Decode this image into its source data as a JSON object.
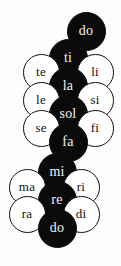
{
  "diagram": {
    "background_color": "#fdfdfd",
    "filled_color": "#0a0a0a",
    "filled_text_color": "#f2f2f2",
    "open_color": "#ffffff",
    "open_text_color": "#111111",
    "notes": [
      {
        "label": "do",
        "style": "filled",
        "cx": 86,
        "cy": 31,
        "d": 39,
        "font_size": 14
      },
      {
        "label": "ti",
        "style": "filled",
        "cx": 68,
        "cy": 58,
        "d": 39,
        "font_size": 14
      },
      {
        "label": "te",
        "style": "open",
        "cx": 41,
        "cy": 72,
        "d": 37,
        "font_size": 13
      },
      {
        "label": "li",
        "style": "open",
        "cx": 95,
        "cy": 72,
        "d": 37,
        "font_size": 13
      },
      {
        "label": "la",
        "style": "filled",
        "cx": 68,
        "cy": 86,
        "d": 39,
        "font_size": 14
      },
      {
        "label": "le",
        "style": "open",
        "cx": 41,
        "cy": 100,
        "d": 37,
        "font_size": 13
      },
      {
        "label": "si",
        "style": "open",
        "cx": 95,
        "cy": 100,
        "d": 37,
        "font_size": 13
      },
      {
        "label": "sol",
        "style": "filled",
        "cx": 68,
        "cy": 114,
        "d": 39,
        "font_size": 14
      },
      {
        "label": "se",
        "style": "open",
        "cx": 41,
        "cy": 128,
        "d": 37,
        "font_size": 13
      },
      {
        "label": "fi",
        "style": "open",
        "cx": 95,
        "cy": 128,
        "d": 37,
        "font_size": 13
      },
      {
        "label": "fa",
        "style": "filled",
        "cx": 68,
        "cy": 142,
        "d": 39,
        "font_size": 14
      },
      {
        "label": "mi",
        "style": "filled",
        "cx": 57,
        "cy": 172,
        "d": 39,
        "font_size": 14
      },
      {
        "label": "ma",
        "style": "open",
        "cx": 27,
        "cy": 187,
        "d": 37,
        "font_size": 13
      },
      {
        "label": "ri",
        "style": "open",
        "cx": 81,
        "cy": 187,
        "d": 37,
        "font_size": 13
      },
      {
        "label": "re",
        "style": "filled",
        "cx": 57,
        "cy": 200,
        "d": 39,
        "font_size": 14
      },
      {
        "label": "ra",
        "style": "open",
        "cx": 27,
        "cy": 214,
        "d": 37,
        "font_size": 13
      },
      {
        "label": "di",
        "style": "open",
        "cx": 81,
        "cy": 214,
        "d": 37,
        "font_size": 13
      },
      {
        "label": "do",
        "style": "filled",
        "cx": 57,
        "cy": 228,
        "d": 39,
        "font_size": 14
      }
    ]
  }
}
